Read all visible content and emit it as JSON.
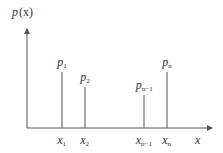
{
  "diagram": {
    "type": "discrete probability distribution (stem plot)",
    "y_axis_label": {
      "base": "p",
      "rest": "(x)"
    },
    "x_axis_label": "x",
    "colors": {
      "stroke": "#555555",
      "text": "#333333"
    },
    "stems": [
      {
        "x_label": {
          "base": "x",
          "sub": "1"
        },
        "p_label": {
          "base": "p",
          "sub": "1"
        },
        "x": 62,
        "top": 72
      },
      {
        "x_label": {
          "base": "x",
          "sub": "2"
        },
        "p_label": {
          "base": "p",
          "sub": "2"
        },
        "x": 85,
        "top": 87
      },
      {
        "x_label": {
          "base": "x",
          "sub": "n−1"
        },
        "p_label": {
          "base": "p",
          "sub": "n−1"
        },
        "x": 144,
        "top": 95
      },
      {
        "x_label": {
          "base": "x",
          "sub": "n"
        },
        "p_label": {
          "base": "p",
          "sub": "n"
        },
        "x": 167,
        "top": 72
      }
    ]
  }
}
